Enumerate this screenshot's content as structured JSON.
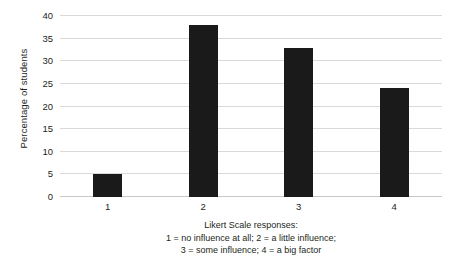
{
  "chart_data": {
    "type": "bar",
    "title": "",
    "subtitle": "",
    "categories": [
      "1",
      "2",
      "3",
      "4"
    ],
    "values": [
      5,
      38,
      33,
      24
    ],
    "series": [
      {
        "name": "Percentage of students",
        "values": [
          5,
          38,
          33,
          24
        ]
      }
    ],
    "xlabel": "Likert Scale responses:",
    "ylabel": "Percentage of students",
    "ylim": [
      0,
      40
    ],
    "ytick_labels": [
      "0",
      "5",
      "10",
      "15",
      "20",
      "25",
      "30",
      "35",
      "40"
    ],
    "ytick_values": [
      0,
      5,
      10,
      15,
      20,
      25,
      30,
      35,
      40
    ],
    "xtick_labels": [
      "1",
      "2",
      "3",
      "4"
    ],
    "grid": "horizontal",
    "legend": "none",
    "bar_color": "#1a1a1a",
    "gridline_color": "#d9d9d9",
    "background_color": "#ffffff",
    "annotations": [
      "Likert Scale responses:",
      "1 = no influence at all; 2 = a little influence;",
      "3 = some influence; 4 = a big factor"
    ]
  },
  "caption": {
    "line1": "Likert Scale responses:",
    "line2": "1 = no influence at all; 2 = a little influence;",
    "line3": "3 = some influence; 4 = a big factor"
  }
}
